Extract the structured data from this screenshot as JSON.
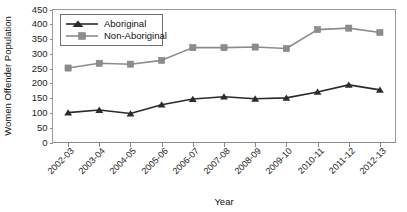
{
  "chart_data": {
    "type": "line",
    "title": "",
    "xlabel": "Year",
    "ylabel": "Women Offender Population",
    "categories": [
      "2002-03",
      "2003-04",
      "2004-05",
      "2005-06",
      "2006-07",
      "2007-08",
      "2008-09",
      "2009-10",
      "2010-11",
      "2011-12",
      "2012-13"
    ],
    "series": [
      {
        "name": "Aboriginal",
        "color": "#2b2b2b",
        "marker": "triangle",
        "values": [
          101,
          110,
          98,
          128,
          147,
          155,
          148,
          151,
          171,
          195,
          178
        ]
      },
      {
        "name": "Non-Aboriginal",
        "color": "#8c8c8c",
        "marker": "square",
        "values": [
          252,
          268,
          265,
          278,
          321,
          321,
          323,
          318,
          382,
          387,
          372
        ]
      }
    ],
    "ylim": [
      0,
      450
    ],
    "yticks": [
      0,
      50,
      100,
      150,
      200,
      250,
      300,
      350,
      400,
      450
    ],
    "ytick_labels": [
      "0",
      "50",
      "100",
      "150",
      "200",
      "250",
      "300",
      "350",
      "400",
      "450"
    ],
    "grid": false,
    "legend_position": "top-left"
  },
  "legend": {
    "entries": [
      {
        "label": "Aboriginal"
      },
      {
        "label": "Non-Aboriginal"
      }
    ]
  },
  "axes": {
    "x_title": "Year",
    "y_title": "Women Offender Population"
  }
}
